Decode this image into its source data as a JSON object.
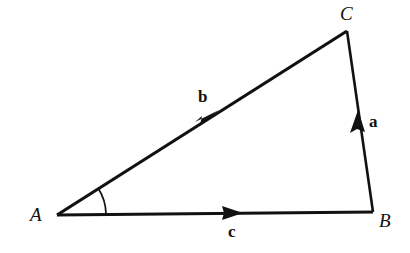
{
  "figure": {
    "kind": "vector-triangle-diagram",
    "background_color": "#ffffff",
    "stroke_color": "#111111",
    "width": 410,
    "height": 253
  },
  "vertices": [
    {
      "label": "A",
      "x": 57,
      "y": 215,
      "label_x": 30,
      "label_y": 205
    },
    {
      "label": "B",
      "x": 373,
      "y": 212,
      "label_x": 379,
      "label_y": 211
    },
    {
      "label": "C",
      "x": 347,
      "y": 31,
      "label_x": 340,
      "label_y": 4
    }
  ],
  "edges": [
    {
      "name": "side-AB",
      "vector_label": "c",
      "from": "A",
      "to": "B",
      "x1": 57,
      "y1": 215,
      "x2": 373,
      "y2": 212,
      "arrow_t": 0.56,
      "label_x": 228,
      "label_y": 223
    },
    {
      "name": "side-AC",
      "vector_label": "b",
      "from": "A",
      "to": "C",
      "x1": 57,
      "y1": 215,
      "x2": 347,
      "y2": 31,
      "arrow_t": 0.52,
      "label_x": 198,
      "label_y": 88
    },
    {
      "name": "side-BC",
      "vector_label": "a",
      "from": "B",
      "to": "C",
      "x1": 373,
      "y1": 212,
      "x2": 347,
      "y2": 31,
      "arrow_t": 0.5,
      "label_x": 369,
      "label_y": 113
    }
  ],
  "angle_arc": {
    "name": "angle-at-A",
    "vertex": "A",
    "radius": 49,
    "start_x": 106,
    "start_y": 214,
    "end_x": 99,
    "end_y": 188
  },
  "vector_labels": {
    "a": "a",
    "b": "b",
    "c": "c"
  },
  "vertex_labels": {
    "A": "A",
    "B": "B",
    "C": "C"
  }
}
